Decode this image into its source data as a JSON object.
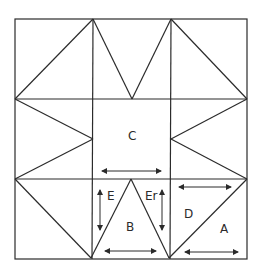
{
  "diagram": {
    "type": "quilt-block-pattern",
    "outer_square": {
      "x1": 15,
      "y1": 19,
      "x2": 247,
      "y2": 259
    },
    "grid": {
      "verticals": [
        93,
        171
      ],
      "horizontals": [
        99,
        179
      ]
    },
    "labels": {
      "center": "C",
      "left_side": "E",
      "right_side": "Er",
      "bottom_center": "B",
      "corner_upper": "D",
      "corner_lower": "A"
    },
    "arrows": [
      {
        "id": "arrow-c-grain",
        "direction": "horizontal"
      },
      {
        "id": "arrow-e-grain",
        "direction": "vertical"
      },
      {
        "id": "arrow-er-grain",
        "direction": "vertical"
      },
      {
        "id": "arrow-b-grain",
        "direction": "horizontal"
      },
      {
        "id": "arrow-d-grain",
        "direction": "horizontal"
      },
      {
        "id": "arrow-a-grain",
        "direction": "horizontal"
      }
    ],
    "colors": {
      "line": "#2b2b2b",
      "background": "#ffffff"
    }
  }
}
